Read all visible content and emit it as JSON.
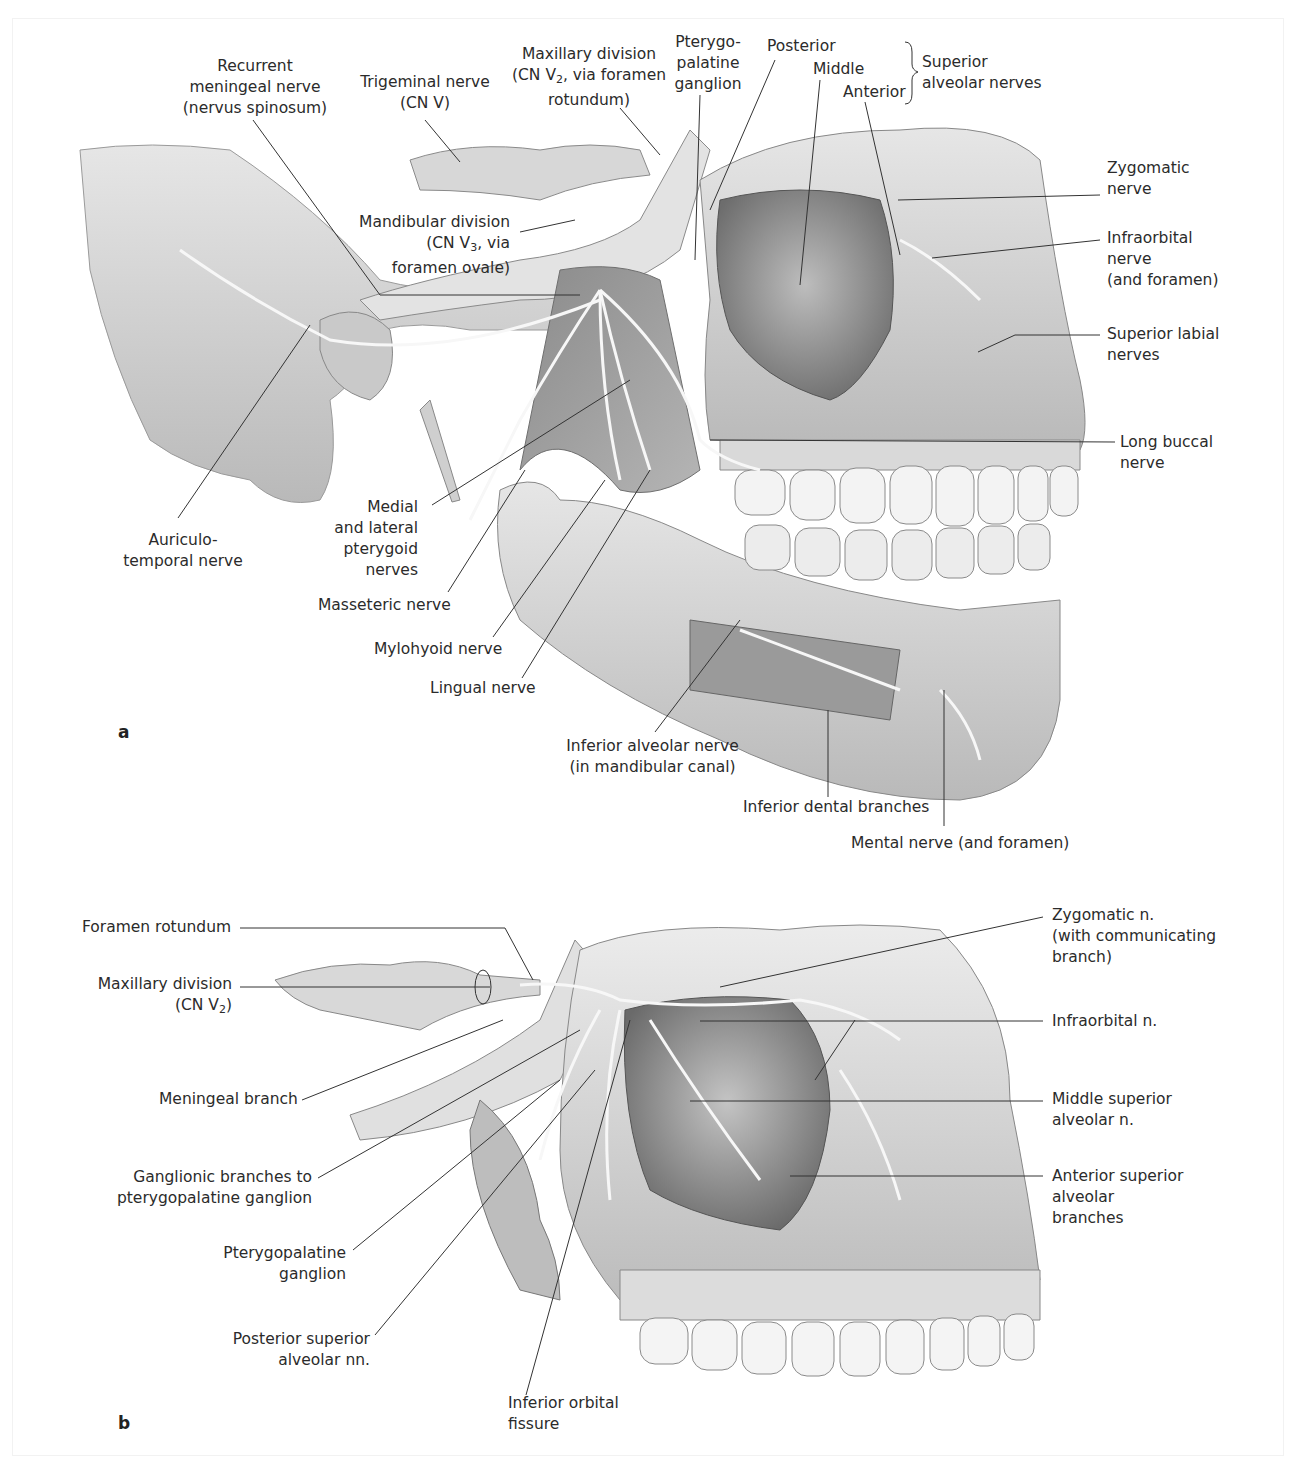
{
  "figure": {
    "colors": {
      "ink": "#2b2b2b",
      "bone": "#d9d9d9",
      "bone_dark": "#8f8f8f",
      "nerve": "#f4f4f4",
      "background": "#ffffff"
    }
  },
  "panel_a": {
    "letter": "a",
    "labels": {
      "recurrent_meningeal": [
        "Recurrent",
        "meningeal nerve",
        "(nervus spinosum)"
      ],
      "trigeminal": [
        "Trigeminal nerve",
        "(CN V)"
      ],
      "maxillary_division": [
        "Maxillary division",
        "(CN V2, via foramen",
        "rotundum)"
      ],
      "pterygopalatine_ganglion": [
        "Pterygo-",
        "palatine",
        "ganglion"
      ],
      "posterior": "Posterior",
      "middle": "Middle",
      "anterior": "Anterior",
      "superior_alveolar_group": [
        "Superior",
        "alveolar nerves"
      ],
      "zygomatic": [
        "Zygomatic",
        "nerve"
      ],
      "infraorbital": [
        "Infraorbital",
        "nerve",
        "(and foramen)"
      ],
      "superior_labial": [
        "Superior labial",
        "nerves"
      ],
      "long_buccal": [
        "Long buccal",
        "nerve"
      ],
      "mandibular_division": [
        "Mandibular division",
        "(CN V3, via",
        "foramen ovale)"
      ],
      "auriculotemporal": [
        "Auriculo-",
        "temporal nerve"
      ],
      "medial_lateral_pterygoid": [
        "Medial",
        "and lateral",
        "pterygoid",
        "nerves"
      ],
      "masseteric": "Masseteric nerve",
      "mylohyoid": "Mylohyoid nerve",
      "lingual": "Lingual nerve",
      "inferior_alveolar": [
        "Inferior alveolar nerve",
        "(in mandibular canal)"
      ],
      "inferior_dental": "Inferior dental branches",
      "mental": "Mental nerve (and foramen)"
    }
  },
  "panel_b": {
    "letter": "b",
    "labels": {
      "foramen_rotundum": "Foramen rotundum",
      "maxillary_division": [
        "Maxillary division",
        "(CN V2)"
      ],
      "meningeal_branch": "Meningeal branch",
      "ganglionic_branches": [
        "Ganglionic branches to",
        "pterygopalatine ganglion"
      ],
      "pterygopalatine_ganglion": [
        "Pterygopalatine",
        "ganglion"
      ],
      "posterior_superior_alveolar": [
        "Posterior superior",
        "alveolar nn."
      ],
      "inferior_orbital_fissure": [
        "Inferior orbital",
        "fissure"
      ],
      "zygomatic": [
        "Zygomatic n.",
        "(with communicating",
        "branch)"
      ],
      "infraorbital": "Infraorbital n.",
      "middle_superior_alveolar": [
        "Middle superior",
        "alveolar n."
      ],
      "anterior_superior_alveolar": [
        "Anterior superior",
        "alveolar",
        "branches"
      ]
    }
  }
}
